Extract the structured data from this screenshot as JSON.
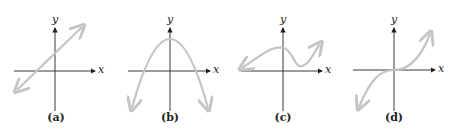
{
  "panels": [
    {
      "id": "a",
      "label": "(a)",
      "x_label": "x",
      "y_label": "y",
      "curve": "line"
    },
    {
      "id": "b",
      "label": "(b)",
      "x_label": "x",
      "y_label": "y",
      "curve": "downward parabola"
    },
    {
      "id": "c",
      "label": "(c)",
      "x_label": "x",
      "y_label": "y",
      "curve": "cubic with local max and min"
    },
    {
      "id": "d",
      "label": "(d)",
      "x_label": "x",
      "y_label": "y",
      "curve": "increasing cubic through origin"
    }
  ],
  "colors": {
    "axis": "#222222",
    "curve": "#c4c4c4"
  }
}
